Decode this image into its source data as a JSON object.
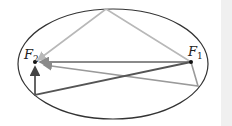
{
  "diagram": {
    "type": "ellipse-reflection",
    "foci": [
      {
        "id": "F1",
        "label": "F",
        "subscript": "1",
        "x": 191,
        "y": 62
      },
      {
        "id": "F2",
        "label": "F",
        "subscript": "2",
        "x": 35,
        "y": 62
      }
    ],
    "ellipse": {
      "cx": 113,
      "cy": 64,
      "rx": 95,
      "ry": 55,
      "stroke": "#333333"
    },
    "rays": [
      {
        "name": "light-ray-top",
        "color": "#b8b8b8",
        "points": [
          [
            191,
            62
          ],
          [
            106,
            9
          ],
          [
            38,
            60
          ]
        ]
      },
      {
        "name": "direct-ray",
        "color": "#8a8a8a",
        "points": [
          [
            191,
            62
          ],
          [
            40,
            62
          ]
        ]
      },
      {
        "name": "ray-bottom-right",
        "color": "#8f8f8f",
        "points": [
          [
            191,
            62
          ],
          [
            198,
            86
          ],
          [
            42,
            64
          ]
        ]
      },
      {
        "name": "dark-ray-bottom-left",
        "color": "#555555",
        "points": [
          [
            191,
            62
          ],
          [
            35,
            95
          ],
          [
            35,
            66
          ]
        ]
      }
    ]
  }
}
